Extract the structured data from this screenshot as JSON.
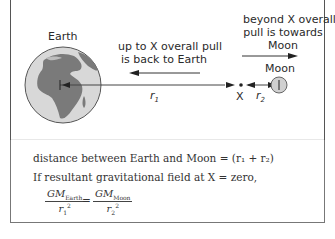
{
  "diagram": {
    "labels": {
      "earth": "Earth",
      "moon": "Moon",
      "x_point": "X",
      "r1": "r",
      "r1_sub": "1",
      "r2": "r",
      "r2_sub": "2",
      "left_note_line1": "up to X overall pull",
      "left_note_line2": "is back to Earth",
      "right_note_line1": "beyond X overall",
      "right_note_line2": "pull is towards",
      "right_note_line3": "Moon"
    },
    "colors": {
      "ocean": "#d8d8d8",
      "land": "#7a7a7a",
      "outline": "#555555",
      "moon_fill": "#d0d0d0"
    }
  },
  "formula": {
    "line1": "distance between Earth and Moon = (r₁ + r₂)",
    "line2": "If resultant gravitational field at X = zero,",
    "lhs_num": "GM",
    "lhs_num_sub": "Earth",
    "lhs_den": "r",
    "lhs_den_sub": "1",
    "lhs_den_sup": "2",
    "equals": "=",
    "rhs_num": "GM",
    "rhs_num_sub": "Moon",
    "rhs_den": "r",
    "rhs_den_sub": "2",
    "rhs_den_sup": "2"
  }
}
